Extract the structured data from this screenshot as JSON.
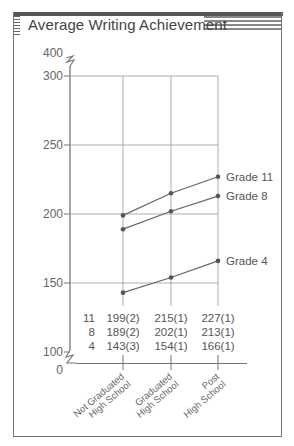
{
  "chart_data": {
    "type": "line",
    "title": "Average Writing Achievement",
    "xlabel": "",
    "ylabel": "",
    "categories": [
      "Not Graduated High School",
      "Graduated High School",
      "Post High School"
    ],
    "category_lines": [
      [
        "Not Graduated",
        "High School"
      ],
      [
        "Graduated",
        "High School"
      ],
      [
        "Post",
        "High School"
      ]
    ],
    "y_ticks": [
      "400",
      "300",
      "250",
      "200",
      "150",
      "100",
      "0"
    ],
    "ylim": [
      100,
      300
    ],
    "axis_breaks": [
      "between 300 and 400",
      "between 0 and 100"
    ],
    "grid": true,
    "series": [
      {
        "name": "Grade 11",
        "values": [
          199,
          215,
          227
        ],
        "std_errors": [
          2,
          1,
          1
        ]
      },
      {
        "name": "Grade 8",
        "values": [
          189,
          202,
          213
        ],
        "std_errors": [
          2,
          1,
          1
        ]
      },
      {
        "name": "Grade 4",
        "values": [
          143,
          154,
          166
        ],
        "std_errors": [
          3,
          1,
          1
        ]
      }
    ],
    "legend_position": "inline-right",
    "data_table": {
      "rows": [
        {
          "grade": "11",
          "cells": [
            "199(2)",
            "215(1)",
            "227(1)"
          ]
        },
        {
          "grade": "8",
          "cells": [
            "189(2)",
            "202(1)",
            "213(1)"
          ]
        },
        {
          "grade": "4",
          "cells": [
            "143(3)",
            "154(1)",
            "166(1)"
          ]
        }
      ]
    }
  },
  "colors": {
    "line": "#666666",
    "grid": "#999999",
    "frame": "#777777",
    "banner": "#555555"
  }
}
